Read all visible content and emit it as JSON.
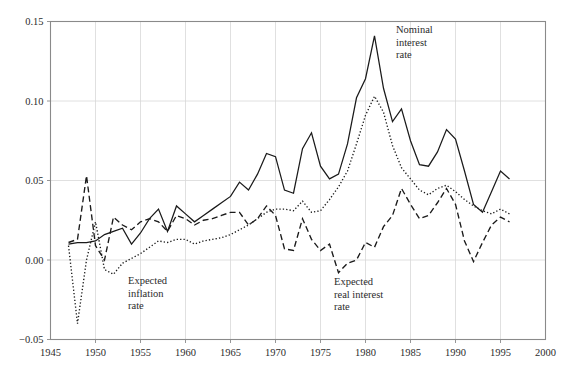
{
  "chart_data": {
    "type": "line",
    "title": "",
    "subtitle": "",
    "xlabel": "",
    "ylabel": "",
    "xlim": [
      1945,
      2000
    ],
    "ylim": [
      -0.05,
      0.15
    ],
    "grid": true,
    "grid_color": "#d8d8d8",
    "frame_color": "#8a8a8a",
    "line_color": "#1a1a1a",
    "background": "#ffffff",
    "legend_position": "inline-annotations",
    "x_ticks": [
      1945,
      1950,
      1955,
      1960,
      1965,
      1970,
      1975,
      1980,
      1985,
      1990,
      1995,
      2000
    ],
    "x_tick_labels": [
      "1945",
      "1950",
      "1955",
      "1960",
      "1965",
      "1970",
      "1975",
      "1980",
      "1985",
      "1990",
      "1995",
      "2000"
    ],
    "y_ticks": [
      -0.05,
      0.0,
      0.05,
      0.1,
      0.15
    ],
    "y_tick_labels": [
      "−0.05",
      "0.00",
      "0.05",
      "0.10",
      "0.15"
    ],
    "x": [
      1947,
      1948,
      1949,
      1950,
      1951,
      1952,
      1953,
      1954,
      1955,
      1956,
      1957,
      1958,
      1959,
      1960,
      1961,
      1962,
      1963,
      1964,
      1965,
      1966,
      1967,
      1968,
      1969,
      1970,
      1971,
      1972,
      1973,
      1974,
      1975,
      1976,
      1977,
      1978,
      1979,
      1980,
      1981,
      1982,
      1983,
      1984,
      1985,
      1986,
      1987,
      1988,
      1989,
      1990,
      1991,
      1992,
      1993,
      1994,
      1995,
      1996
    ],
    "series": [
      {
        "name": "Nominal interest rate",
        "style": "solid",
        "annotation": "Nominal\ninterest\nrate",
        "annotation_lines": [
          "Nominal",
          "interest",
          "rate"
        ],
        "values": [
          0.01,
          0.011,
          0.011,
          0.012,
          0.016,
          0.018,
          0.02,
          0.01,
          0.017,
          0.026,
          0.032,
          0.018,
          0.034,
          0.029,
          0.024,
          0.028,
          0.032,
          0.036,
          0.04,
          0.049,
          0.044,
          0.054,
          0.067,
          0.065,
          0.044,
          0.042,
          0.07,
          0.08,
          0.059,
          0.051,
          0.054,
          0.073,
          0.102,
          0.114,
          0.141,
          0.108,
          0.087,
          0.095,
          0.075,
          0.06,
          0.059,
          0.068,
          0.082,
          0.076,
          0.056,
          0.035,
          0.03,
          0.043,
          0.056,
          0.051
        ]
      },
      {
        "name": "Expected inflation rate",
        "style": "dotted",
        "annotation": "Expected\ninflation\nrate",
        "annotation_lines": [
          "Expected",
          "inflation",
          "rate"
        ],
        "values": [
          0.009,
          -0.04,
          0.0,
          0.024,
          -0.006,
          -0.009,
          -0.002,
          0.001,
          0.004,
          0.008,
          0.012,
          0.011,
          0.013,
          0.013,
          0.01,
          0.012,
          0.013,
          0.014,
          0.016,
          0.019,
          0.022,
          0.026,
          0.03,
          0.032,
          0.032,
          0.031,
          0.037,
          0.03,
          0.031,
          0.038,
          0.046,
          0.056,
          0.073,
          0.091,
          0.103,
          0.093,
          0.072,
          0.058,
          0.051,
          0.044,
          0.041,
          0.045,
          0.047,
          0.043,
          0.038,
          0.034,
          0.031,
          0.029,
          0.032,
          0.029
        ]
      },
      {
        "name": "Expected real interest rate",
        "style": "dashed",
        "annotation": "Expected\nreal interest\nrate",
        "annotation_lines": [
          "Expected",
          "real interest",
          "rate"
        ],
        "values": [
          0.011,
          0.013,
          0.053,
          0.009,
          0.0,
          0.027,
          0.022,
          0.019,
          0.024,
          0.026,
          0.024,
          0.018,
          0.028,
          0.026,
          0.022,
          0.025,
          0.026,
          0.028,
          0.03,
          0.03,
          0.022,
          0.026,
          0.034,
          0.028,
          0.007,
          0.006,
          0.026,
          0.013,
          0.006,
          0.01,
          -0.008,
          -0.002,
          0.0,
          0.011,
          0.008,
          0.021,
          0.028,
          0.045,
          0.035,
          0.026,
          0.028,
          0.036,
          0.045,
          0.035,
          0.012,
          -0.001,
          0.011,
          0.022,
          0.027,
          0.024
        ]
      }
    ],
    "annotations": [
      {
        "id": "nominal-label",
        "text_lines": [
          "Nominal",
          "interest",
          "rate"
        ],
        "x_px": 396,
        "y_px": 33
      },
      {
        "id": "inflation-label",
        "text_lines": [
          "Expected",
          "inflation",
          "rate"
        ],
        "x_px": 128,
        "y_px": 284
      },
      {
        "id": "real-label",
        "text_lines": [
          "Expected",
          "real interest",
          "rate"
        ],
        "x_px": 334,
        "y_px": 285
      }
    ]
  }
}
